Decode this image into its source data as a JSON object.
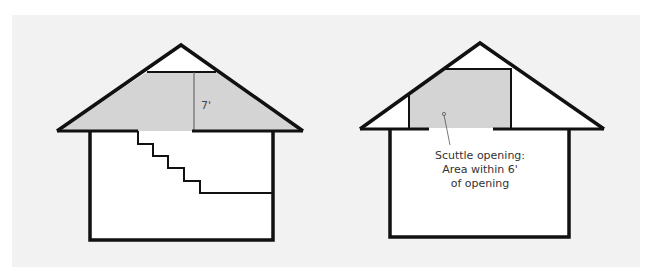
{
  "figure": {
    "panel_background": "#f2f2f2",
    "page_background": "#ffffff",
    "shade_color": "#d4d4d4",
    "line_color": "#111111",
    "thin_line_color": "#555555"
  },
  "diagrams": [
    {
      "id": "left-house",
      "description": "House cross-section with stairway to attic; shaded attic area with 7 ft headroom",
      "labels": {
        "height_dimension": "7'"
      }
    },
    {
      "id": "right-house",
      "description": "House cross-section with scuttle opening; shaded attic area within 6 ft of opening",
      "labels": {
        "callout_line1": "Scuttle opening:",
        "callout_line2": "Area within 6'",
        "callout_line3": "of opening"
      }
    }
  ]
}
